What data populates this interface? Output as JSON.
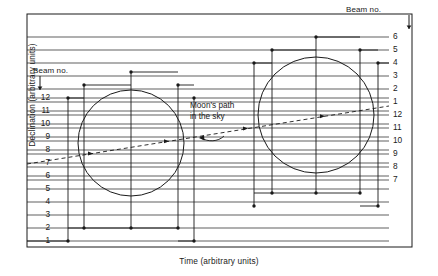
{
  "figure": {
    "axis_y_label": "Declination (arbitrary units)",
    "axis_x_label": "Time (arbitrary units)",
    "beam_caption_left": "Beam no.",
    "beam_caption_right": "Beam no.",
    "annotation_line1": "Moon's path",
    "annotation_line2": "in the sky"
  },
  "chart_data": {
    "type": "line",
    "title": "",
    "xlabel": "Time (arbitrary units)",
    "ylabel": "Declination (arbitrary units)",
    "grid": true,
    "legend": "none",
    "left_beam_labels": [
      "12",
      "11",
      "10",
      "9",
      "8",
      "7",
      "6",
      "5",
      "4",
      "3",
      "2",
      "1"
    ],
    "right_beam_labels": [
      "6",
      "5",
      "4",
      "3",
      "2",
      "1",
      "12",
      "11",
      "10",
      "9",
      "8",
      "7"
    ],
    "left_beam_rows_y": [
      98,
      111,
      124,
      137,
      150,
      163,
      176,
      189,
      202,
      215,
      228,
      241
    ],
    "right_beam_rows_y": [
      37,
      50,
      63,
      76,
      89,
      102,
      115,
      128,
      141,
      154,
      167,
      180
    ],
    "gridline_x_start": 27,
    "gridline_x_end": 389,
    "frame": {
      "x": 27,
      "y": 14,
      "width": 385,
      "height": 233
    },
    "circles": [
      {
        "cx": 131,
        "cy": 143,
        "r": 53
      },
      {
        "cx": 316,
        "cy": 115,
        "r": 58
      }
    ],
    "moon_path": {
      "style": "dashed",
      "x1": 27,
      "y1": 164,
      "x2": 389,
      "y2": 106,
      "markers_x": [
        92,
        168,
        247,
        324
      ]
    },
    "step_traces_left": [
      {
        "x": 68,
        "top_y": 98,
        "bottom_y": 241
      },
      {
        "x": 84,
        "top_y": 85,
        "bottom_y": 228
      },
      {
        "x": 131,
        "top_y": 72,
        "bottom_y": 228
      },
      {
        "x": 178,
        "top_y": 85,
        "bottom_y": 228
      },
      {
        "x": 194,
        "top_y": 98,
        "bottom_y": 241
      }
    ],
    "step_traces_right": [
      {
        "x": 254,
        "top_y": 63,
        "bottom_y": 206
      },
      {
        "x": 272,
        "top_y": 50,
        "bottom_y": 193
      },
      {
        "x": 316,
        "top_y": 37,
        "bottom_y": 193
      },
      {
        "x": 360,
        "top_y": 50,
        "bottom_y": 193
      },
      {
        "x": 378,
        "top_y": 63,
        "bottom_y": 206
      }
    ]
  }
}
